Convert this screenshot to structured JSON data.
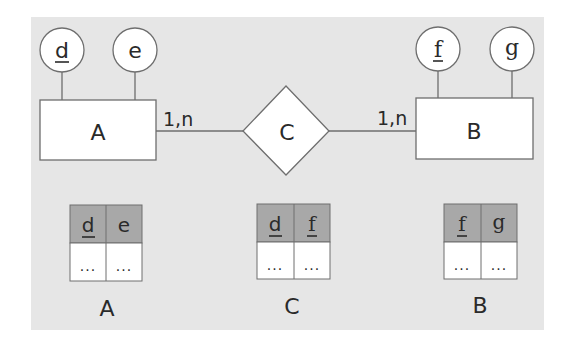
{
  "diagram": {
    "type": "er-diagram-to-relational-mapping",
    "colors": {
      "panel_background": "#e6e6e6",
      "shape_fill": "#ffffff",
      "stroke": "#6e6e6e",
      "table_header_fill": "#a8a8a8",
      "text": "#2a2a2a"
    },
    "entities": [
      {
        "name": "A",
        "attributes": [
          {
            "name": "d",
            "key": true
          },
          {
            "name": "e",
            "key": false
          }
        ]
      },
      {
        "name": "B",
        "attributes": [
          {
            "name": "f",
            "key": true
          },
          {
            "name": "g",
            "key": false
          }
        ]
      }
    ],
    "relationship": {
      "name": "C",
      "left_cardinality": "1,n",
      "right_cardinality": "1,n"
    },
    "tables": [
      {
        "name": "A",
        "columns": [
          "d",
          "e"
        ],
        "key_columns": [
          "d"
        ],
        "row": [
          "...",
          "..."
        ]
      },
      {
        "name": "C",
        "columns": [
          "d",
          "f"
        ],
        "key_columns": [
          "d",
          "f"
        ],
        "row": [
          "...",
          "..."
        ]
      },
      {
        "name": "B",
        "columns": [
          "f",
          "g"
        ],
        "key_columns": [
          "f"
        ],
        "row": [
          "...",
          "..."
        ]
      }
    ]
  }
}
